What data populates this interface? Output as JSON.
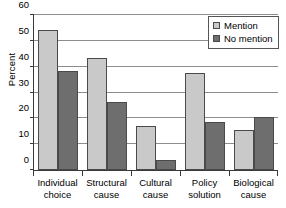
{
  "chart_data": {
    "type": "bar",
    "title": "",
    "xlabel": "",
    "ylabel": "Percent",
    "ylim": [
      0,
      60
    ],
    "yticks": [
      0,
      10,
      20,
      30,
      40,
      50,
      60
    ],
    "ytick_labels": [
      "0",
      "10",
      "20",
      "30",
      "40",
      "50",
      "60"
    ],
    "grid": true,
    "legend_position": "top-right",
    "categories": [
      "Individual choice",
      "Structural cause",
      "Cultural cause",
      "Policy solution",
      "Biological cause"
    ],
    "category_lines": [
      [
        "Individual",
        "choice"
      ],
      [
        "Structural",
        "cause"
      ],
      [
        "Cultural",
        "cause"
      ],
      [
        "Policy",
        "solution"
      ],
      [
        "Biological",
        "cause"
      ]
    ],
    "series": [
      {
        "name": "Mention",
        "color": "#c9c9c9",
        "values": [
          54,
          43,
          17,
          37.5,
          15.5
        ]
      },
      {
        "name": "No mention",
        "color": "#6e6e6e",
        "values": [
          38,
          26,
          4,
          18.5,
          20.5
        ]
      }
    ]
  }
}
